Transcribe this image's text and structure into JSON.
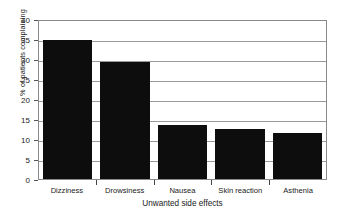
{
  "chart_data": {
    "type": "bar",
    "title": "",
    "subtitle": "",
    "xlabel": "Unwanted side effects",
    "ylabel": "% of patients complaining",
    "categories": [
      "Dizziness",
      "Drowsiness",
      "Nausea",
      "Skin reaction",
      "Asthenia"
    ],
    "values": [
      34.8,
      29.3,
      13.6,
      12.6,
      11.6
    ],
    "ylim": [
      0,
      40
    ],
    "yticks": [
      0,
      5,
      10,
      15,
      20,
      25,
      30,
      35,
      40
    ],
    "ytick_labels": [
      "0",
      "5",
      "10",
      "15",
      "20",
      "25",
      "30",
      "35",
      "40"
    ],
    "grid": "horizontal",
    "legend": "none",
    "bar_color": "#0d0d0d",
    "grid_color": "#9a9a9a",
    "axis_color": "#8a8a8a",
    "background": "#ffffff"
  }
}
